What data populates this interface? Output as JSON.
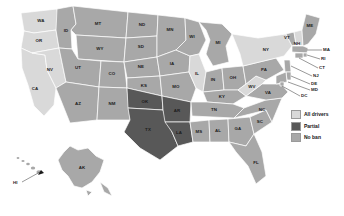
{
  "figure": {
    "type": "choropleth-map",
    "region": "United States",
    "title": "",
    "background": "#ffffff"
  },
  "legend": {
    "position": "right-middle",
    "items": [
      {
        "label": "All drivers",
        "color": "#d9d9d9",
        "key": "all-drivers"
      },
      {
        "label": "Partial",
        "color": "#585858",
        "key": "partial"
      },
      {
        "label": "No ban",
        "color": "#a8a8a8",
        "key": "no-ban"
      }
    ]
  },
  "palette": {
    "all_drivers": "#d9d9d9",
    "partial": "#585858",
    "no_ban": "#a8a8a8",
    "border": "#ffffff",
    "label": "#1b1b1b",
    "leader": "#1b1b1b"
  },
  "states": [
    {
      "code": "WA",
      "category": "all-drivers"
    },
    {
      "code": "OR",
      "category": "all-drivers"
    },
    {
      "code": "CA",
      "category": "all-drivers"
    },
    {
      "code": "NV",
      "category": "all-drivers"
    },
    {
      "code": "ID",
      "category": "no-ban"
    },
    {
      "code": "MT",
      "category": "no-ban"
    },
    {
      "code": "WY",
      "category": "no-ban"
    },
    {
      "code": "UT",
      "category": "no-ban"
    },
    {
      "code": "CO",
      "category": "no-ban"
    },
    {
      "code": "AZ",
      "category": "no-ban"
    },
    {
      "code": "NM",
      "category": "no-ban"
    },
    {
      "code": "ND",
      "category": "no-ban"
    },
    {
      "code": "SD",
      "category": "no-ban"
    },
    {
      "code": "NE",
      "category": "no-ban"
    },
    {
      "code": "KS",
      "category": "no-ban"
    },
    {
      "code": "OK",
      "category": "partial"
    },
    {
      "code": "TX",
      "category": "partial"
    },
    {
      "code": "MN",
      "category": "no-ban"
    },
    {
      "code": "IA",
      "category": "no-ban"
    },
    {
      "code": "MO",
      "category": "no-ban"
    },
    {
      "code": "AR",
      "category": "partial"
    },
    {
      "code": "LA",
      "category": "partial"
    },
    {
      "code": "WI",
      "category": "no-ban"
    },
    {
      "code": "IL",
      "category": "all-drivers"
    },
    {
      "code": "MI",
      "category": "no-ban"
    },
    {
      "code": "IN",
      "category": "no-ban"
    },
    {
      "code": "OH",
      "category": "no-ban"
    },
    {
      "code": "KY",
      "category": "no-ban"
    },
    {
      "code": "TN",
      "category": "no-ban"
    },
    {
      "code": "MS",
      "category": "no-ban"
    },
    {
      "code": "AL",
      "category": "no-ban"
    },
    {
      "code": "GA",
      "category": "no-ban"
    },
    {
      "code": "FL",
      "category": "no-ban"
    },
    {
      "code": "SC",
      "category": "no-ban"
    },
    {
      "code": "NC",
      "category": "no-ban"
    },
    {
      "code": "VA",
      "category": "no-ban"
    },
    {
      "code": "WV",
      "category": "all-drivers"
    },
    {
      "code": "PA",
      "category": "no-ban"
    },
    {
      "code": "NY",
      "category": "all-drivers"
    },
    {
      "code": "VT",
      "category": "no-ban"
    },
    {
      "code": "NH",
      "category": "all-drivers"
    },
    {
      "code": "ME",
      "category": "no-ban"
    },
    {
      "code": "MA",
      "category": "no-ban"
    },
    {
      "code": "RI",
      "category": "no-ban"
    },
    {
      "code": "CT",
      "category": "no-ban"
    },
    {
      "code": "NJ",
      "category": "no-ban"
    },
    {
      "code": "DE",
      "category": "no-ban"
    },
    {
      "code": "MD",
      "category": "no-ban"
    },
    {
      "code": "DC",
      "category": "no-ban"
    },
    {
      "code": "AK",
      "category": "no-ban"
    },
    {
      "code": "HI",
      "category": "no-ban"
    }
  ],
  "callouts": [
    {
      "code": "MA",
      "note": "leader-line"
    },
    {
      "code": "RI",
      "note": "leader-line"
    },
    {
      "code": "CT",
      "note": "leader-line"
    },
    {
      "code": "NJ",
      "note": "leader-line"
    },
    {
      "code": "DE",
      "note": "leader-line"
    },
    {
      "code": "MD",
      "note": "leader-line"
    },
    {
      "code": "DC",
      "note": "leader-line"
    },
    {
      "code": "HI",
      "note": "arrow-to-islands"
    }
  ],
  "labels": {
    "WA": "WA",
    "OR": "OR",
    "CA": "CA",
    "NV": "NV",
    "ID": "ID",
    "MT": "MT",
    "WY": "WY",
    "UT": "UT",
    "CO": "CO",
    "AZ": "AZ",
    "NM": "NM",
    "ND": "ND",
    "SD": "SD",
    "NE": "NE",
    "KS": "KS",
    "OK": "OK",
    "TX": "TX",
    "MN": "MN",
    "IA": "IA",
    "MO": "MO",
    "AR": "AR",
    "LA": "LA",
    "WI": "WI",
    "IL": "IL",
    "MI": "MI",
    "IN": "IN",
    "OH": "OH",
    "KY": "KY",
    "TN": "TN",
    "MS": "MS",
    "AL": "AL",
    "GA": "GA",
    "FL": "FL",
    "SC": "SC",
    "NC": "NC",
    "VA": "VA",
    "WV": "WV",
    "PA": "PA",
    "NY": "NY",
    "VT": "VT",
    "NH": "NH",
    "ME": "ME",
    "MA": "MA",
    "RI": "RI",
    "CT": "CT",
    "NJ": "NJ",
    "DE": "DE",
    "MD": "MD",
    "DC": "DC",
    "AK": "AK",
    "HI": "HI"
  }
}
